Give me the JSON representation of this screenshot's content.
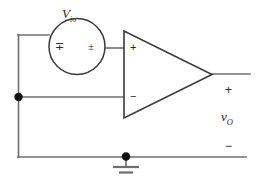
{
  "diagram": {
    "background_color": "#ffffff",
    "line_color": "#6e6e6e",
    "text_color": "#2b2b2b",
    "source": {
      "name_symbol": "V",
      "name_subscript": "io",
      "left_terminal_symbol": "∓",
      "right_terminal_symbol": "±"
    },
    "opamp": {
      "noninverting_terminal": "+",
      "inverting_terminal": "−"
    },
    "output": {
      "plus_sign": "+",
      "minus_sign": "−",
      "voltage_symbol": "v",
      "voltage_subscript": "O"
    },
    "ground": {
      "symbol_name": "ground-symbol"
    }
  }
}
